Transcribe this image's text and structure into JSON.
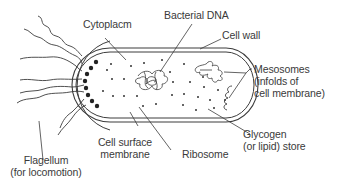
{
  "diagram": {
    "colors": {
      "line": "#3c3c3c",
      "text": "#3a3a3a",
      "background": "#ffffff"
    },
    "labels": {
      "cytoplasm": "Cytoplacm",
      "bacterial_dna": "Bacterial DNA",
      "cell_wall": "Cell wall",
      "mesosomes_1": "Mesosomes",
      "mesosomes_2": "(infolds of",
      "mesosomes_3": "cell membrane)",
      "glycogen_1": "Glycogen",
      "glycogen_2": "(or lipid) store",
      "ribosome": "Ribosome",
      "cell_surface_1": "Cell surface",
      "cell_surface_2": "membrane",
      "flagellum_1": "Flagellum",
      "flagellum_2": "(for locomotion)"
    }
  }
}
